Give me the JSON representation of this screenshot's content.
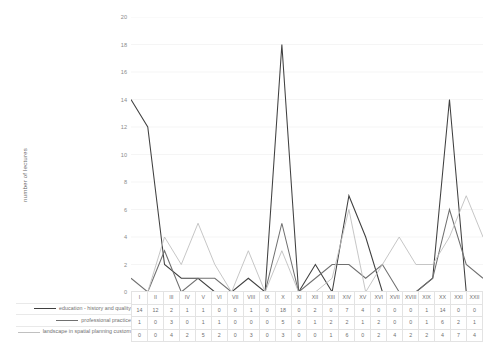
{
  "chart_data": {
    "type": "line",
    "title": "",
    "xlabel": "",
    "ylabel": "number of lectures",
    "ylim": [
      0,
      20
    ],
    "ytick_step": 2,
    "grid": true,
    "legend_position": "bottom-left",
    "categories": [
      "I",
      "II",
      "III",
      "IV",
      "V",
      "VI",
      "VII",
      "VIII",
      "IX",
      "X",
      "XI",
      "XII",
      "XIII",
      "XIV",
      "XV",
      "XVI",
      "XVII",
      "XVIII",
      "XIX",
      "XX",
      "XXI",
      "XXII"
    ],
    "yticks": [
      "20",
      "18",
      "16",
      "14",
      "12",
      "10",
      "8",
      "6",
      "4",
      "2",
      "0"
    ],
    "series": [
      {
        "name": "education - history and quality",
        "color": "#404040",
        "values": [
          14,
          12,
          2,
          1,
          1,
          0,
          0,
          1,
          0,
          18,
          0,
          2,
          0,
          7,
          4,
          0,
          0,
          0,
          1,
          14,
          0,
          0
        ]
      },
      {
        "name": "professional practice",
        "color": "#707070",
        "values": [
          1,
          0,
          3,
          0,
          1,
          1,
          0,
          0,
          0,
          5,
          0,
          1,
          2,
          2,
          1,
          2,
          0,
          0,
          1,
          6,
          2,
          1
        ]
      },
      {
        "name": "landscape in spatial planning custom",
        "color": "#c0c0c0",
        "values": [
          0,
          0,
          4,
          2,
          5,
          2,
          0,
          3,
          0,
          3,
          0,
          0,
          1,
          6,
          0,
          2,
          4,
          2,
          2,
          4,
          7,
          4
        ]
      }
    ]
  }
}
